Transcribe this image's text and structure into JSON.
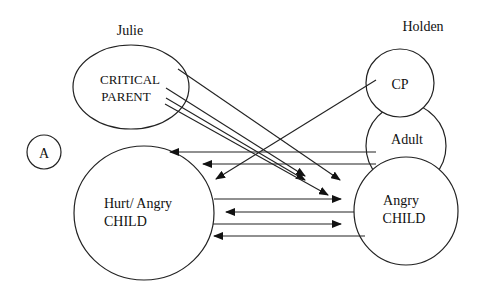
{
  "diagram": {
    "type": "transactional-analysis",
    "left_person": {
      "name": "Julie",
      "states": [
        {
          "id": "julie-cp",
          "label_lines": [
            "CRITICAL",
            "PARENT"
          ]
        },
        {
          "id": "julie-child",
          "label_lines": [
            "Hurt/ Angry",
            "CHILD"
          ]
        }
      ]
    },
    "right_person": {
      "name": "Holden",
      "states": [
        {
          "id": "holden-cp",
          "label_lines": [
            "CP"
          ]
        },
        {
          "id": "holden-adult",
          "label_lines": [
            "Adult"
          ]
        },
        {
          "id": "holden-child",
          "label_lines": [
            "Angry",
            "CHILD"
          ]
        }
      ]
    },
    "marker": "A",
    "transactions": [
      {
        "from": "julie-cp",
        "to": "holden-child",
        "direction": "right"
      },
      {
        "from": "julie-cp",
        "to": "holden-child",
        "direction": "right"
      },
      {
        "from": "julie-cp",
        "to": "holden-child",
        "direction": "right"
      },
      {
        "from": "julie-cp",
        "to": "holden-child",
        "direction": "right"
      },
      {
        "from": "holden-cp",
        "to": "julie-child",
        "direction": "left"
      },
      {
        "from": "holden-adult",
        "to": "julie-child",
        "direction": "left"
      },
      {
        "from": "holden-adult",
        "to": "julie-child",
        "direction": "left"
      },
      {
        "from": "julie-child",
        "to": "holden-child",
        "direction": "right"
      },
      {
        "from": "holden-child",
        "to": "julie-child",
        "direction": "left"
      },
      {
        "from": "julie-child",
        "to": "holden-child",
        "direction": "right"
      },
      {
        "from": "holden-child",
        "to": "julie-child",
        "direction": "left"
      }
    ]
  }
}
